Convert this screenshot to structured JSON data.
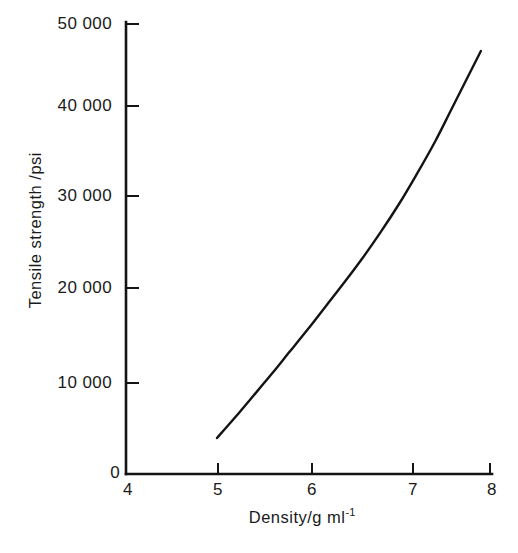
{
  "chart_data": {
    "type": "line",
    "title": "",
    "subtitle": "",
    "xlabel": "Density/g ml",
    "xlabel_superscript": "-1",
    "xlabel_full": "Density/g ml⁻¹",
    "ylabel": "Tensile strength /psi",
    "xlim": [
      4,
      8
    ],
    "ylim": [
      0,
      50000
    ],
    "grid": false,
    "legend": false,
    "legend_position": "none",
    "xticks": [
      4,
      5,
      6,
      7,
      8
    ],
    "xtick_labels": [
      "4",
      "5",
      "6",
      "7",
      "8"
    ],
    "yticks": [
      0,
      10000,
      20000,
      30000,
      40000,
      50000
    ],
    "ytick_labels": [
      "0",
      "10 000",
      "20 000",
      "30 000",
      "40 000",
      "50 000"
    ],
    "series": [
      {
        "name": "tensile strength",
        "x": [
          5.0,
          5.2,
          5.4,
          5.6,
          5.8,
          6.0,
          6.2,
          6.4,
          6.6,
          6.8,
          7.0,
          7.2,
          7.4,
          7.6,
          7.9
        ],
        "values": [
          4000,
          6300,
          8700,
          11100,
          13600,
          16100,
          18700,
          21300,
          24000,
          26900,
          30000,
          33400,
          37000,
          41000,
          47000
        ]
      }
    ],
    "annotations": [],
    "colors": {
      "curve": "#141414",
      "axis": "#141414",
      "background": "#ffffff",
      "text": "#1a1a1a"
    }
  }
}
